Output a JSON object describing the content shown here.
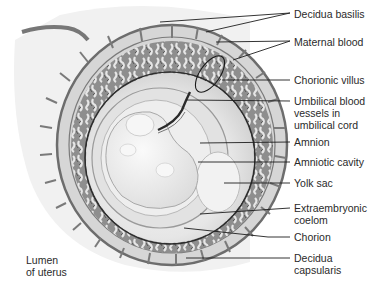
{
  "diagram": {
    "labels": [
      {
        "id": "decidua-basilis",
        "text": "Decidua basilis",
        "x": 294,
        "y": 8
      },
      {
        "id": "maternal-blood",
        "text": "Maternal blood",
        "x": 294,
        "y": 36
      },
      {
        "id": "chorionic-villus",
        "text": "Chorionic villus",
        "x": 294,
        "y": 74
      },
      {
        "id": "umbilical-blood-vessels",
        "text": "Umbilical blood\nvessels in\numbilical cord",
        "x": 294,
        "y": 95
      },
      {
        "id": "amnion",
        "text": "Amnion",
        "x": 294,
        "y": 136
      },
      {
        "id": "amniotic-cavity",
        "text": "Amniotic cavity",
        "x": 294,
        "y": 155
      },
      {
        "id": "yolk-sac",
        "text": "Yolk sac",
        "x": 294,
        "y": 176
      },
      {
        "id": "extraembryonic-coelom",
        "text": "Extraembryonic\ncoelom",
        "x": 294,
        "y": 202
      },
      {
        "id": "chorion",
        "text": "Chorion",
        "x": 294,
        "y": 233
      },
      {
        "id": "decidua-capsularis",
        "text": "Decidua\ncapsularis",
        "x": 294,
        "y": 254
      },
      {
        "id": "lumen-of-uterus",
        "text": "Lumen\nof uterus",
        "x": 26,
        "y": 254
      }
    ],
    "colors": {
      "tissue_dark": "#8a8a8a",
      "tissue_mid": "#b5b5b5",
      "tissue_light": "#d9d9d9",
      "cavity": "#ececec",
      "embryo": "#f4f4f4",
      "line": "#1e1e1e"
    }
  }
}
